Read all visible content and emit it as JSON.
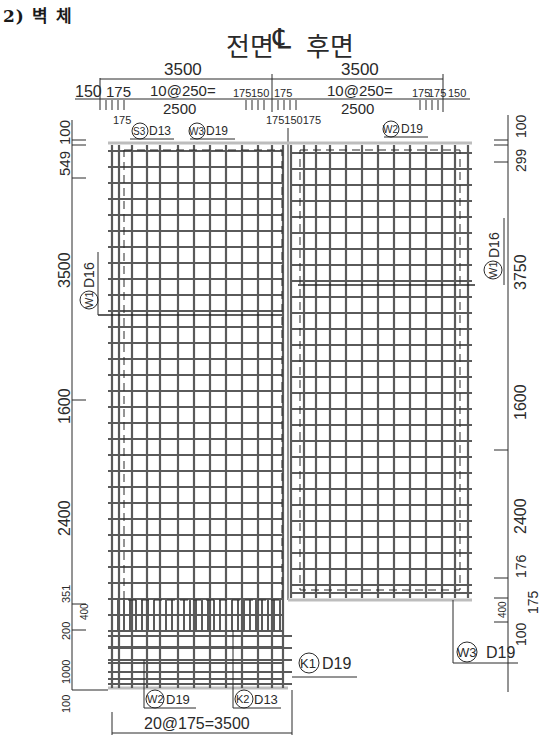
{
  "section_title": "2) 벽 체",
  "header": {
    "front_label": "전면",
    "centerline_symbol": "℄",
    "back_label": "후면"
  },
  "top_dimensions": {
    "left_total": "3500",
    "right_total": "3500",
    "row2": [
      "150",
      "175",
      "10@250=",
      "175",
      "150",
      "175",
      "10@250=",
      "175",
      "175",
      "150"
    ],
    "row3_left": "2500",
    "row3_right": "2500",
    "below_left": "175",
    "below_center": "175150175"
  },
  "left_dimensions": [
    "100",
    "549",
    "3500",
    "1600",
    "2400",
    "351",
    "400",
    "200",
    "1000",
    "100"
  ],
  "right_dimensions": [
    "100",
    "299",
    "3750",
    "1600",
    "2400",
    "176",
    "400",
    "175",
    "100"
  ],
  "bottom_dimension": "20@175=3500",
  "rebar_labels": {
    "s3": {
      "mark": "S3",
      "size": "D13"
    },
    "w3_top": {
      "mark": "W3",
      "size": "D19"
    },
    "w2_top": {
      "mark": "W2",
      "size": "D19"
    },
    "w1_left": {
      "mark": "W1",
      "size": "D16"
    },
    "w1_right": {
      "mark": "W1",
      "size": "D16"
    },
    "k1": {
      "mark": "K1",
      "size": "D19"
    },
    "w3_bottom": {
      "mark": "W3",
      "size": "D19"
    },
    "w2_bottom": {
      "mark": "W2",
      "size": "D19"
    },
    "k2": {
      "mark": "K2",
      "size": "D13"
    }
  },
  "colors": {
    "bar": "#5a5a5a",
    "line": "#2a2a2a",
    "slab": "#bdbdbd"
  },
  "grid": {
    "left_x": 108,
    "center_x": 288,
    "right_x": 472,
    "top_y": 143,
    "left_step_y": 598,
    "right_step_y": 598,
    "left_bottom_y": 688,
    "vertical_bar_xs_left": [
      112,
      119,
      132,
      147,
      160,
      178,
      194,
      210,
      226,
      242,
      258,
      272,
      283
    ],
    "vertical_bar_xs_right": [
      291,
      304,
      316,
      330,
      346,
      362,
      378,
      394,
      410,
      426,
      442,
      455,
      468
    ],
    "horizontal_spacing": 16
  }
}
